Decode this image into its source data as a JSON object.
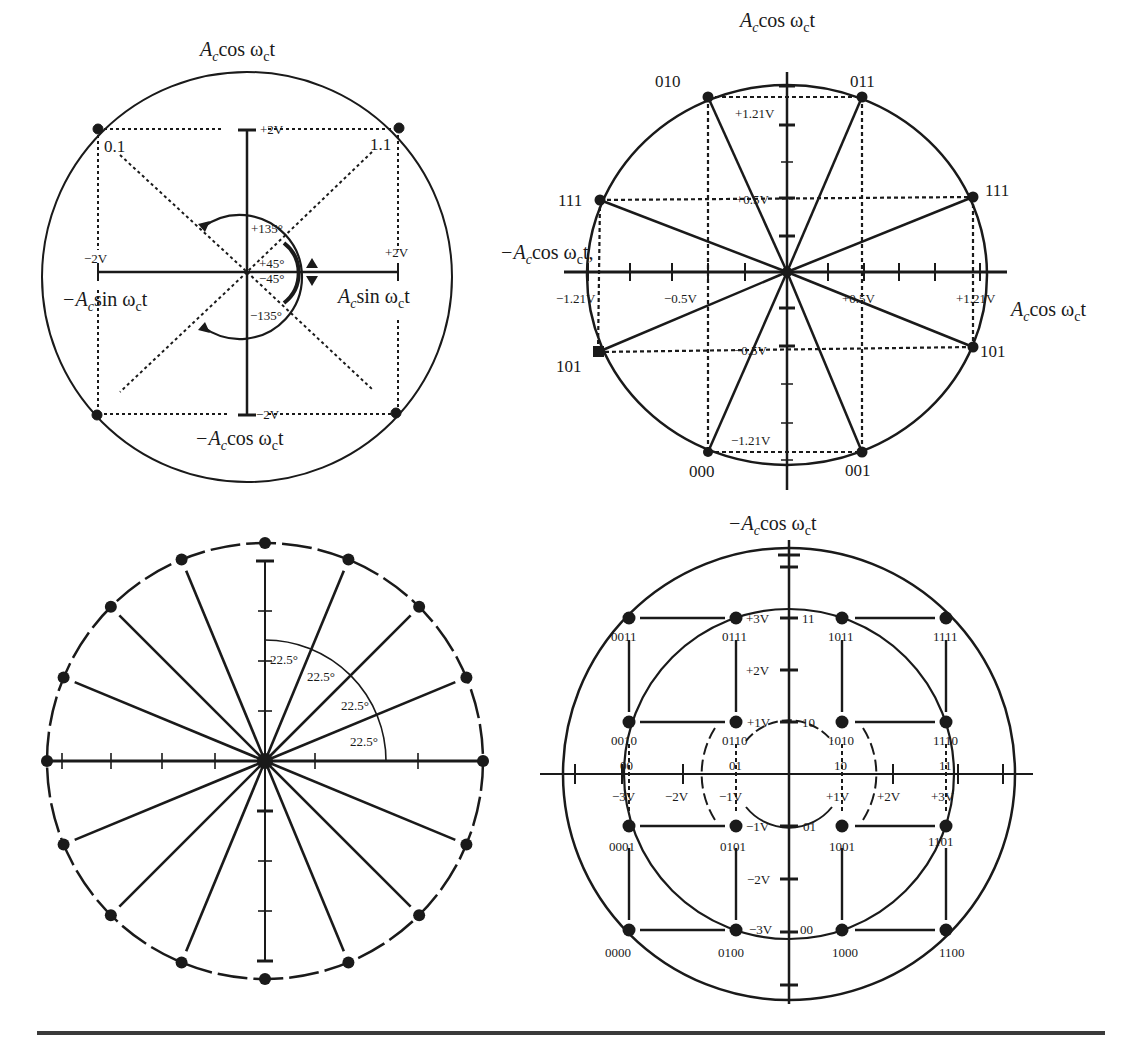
{
  "figure": {
    "rule_color": "#3a3a3a",
    "ink_color": "#1a1a1a"
  },
  "chart_data": [
    {
      "id": "qpsk",
      "type": "scatter",
      "title": "QPSK phasor / constellation",
      "center": [
        247,
        277
      ],
      "outer_radius": 205,
      "axis_labels": {
        "top": "A_c cos ω_c t",
        "bottom": "−A_c cos ω_c t",
        "left": "−A_c sin ω_c t",
        "right": "A_c sin ω_c t"
      },
      "tick_labels": {
        "top": "+2V",
        "bottom": "−2V",
        "left": "−2V",
        "right": "+2V"
      },
      "points": [
        {
          "label": "0.1",
          "x": -2,
          "y": 2
        },
        {
          "label": "1.1",
          "x": 2,
          "y": 2
        },
        {
          "label": "",
          "x": -2,
          "y": -2
        },
        {
          "label": "",
          "x": 2,
          "y": -2
        }
      ],
      "angle_labels": [
        "+135°",
        "+45°",
        "−45°",
        "−135°"
      ]
    },
    {
      "id": "8psk",
      "type": "scatter",
      "title": "8-PSK constellation",
      "center": [
        787,
        272
      ],
      "outer_radius": 198,
      "axis_labels": {
        "top": "A_c cos ω_c t",
        "left": "−A_c cos ω_c t",
        "right": "A_c cos ω_c t"
      },
      "tick_labels": {
        "x": [
          "−1.21V",
          "−0.5V",
          "+0.5V",
          "+1.21V"
        ],
        "y": [
          "+1.21V",
          "+0.5V",
          "−0.5V",
          "−1.21V"
        ]
      },
      "points": [
        {
          "label": "010",
          "x": -0.5,
          "y": 1.21
        },
        {
          "label": "011",
          "x": 0.5,
          "y": 1.21
        },
        {
          "label": "111",
          "x": -1.21,
          "y": 0.5
        },
        {
          "label": "111",
          "x": 1.21,
          "y": 0.5
        },
        {
          "label": "101",
          "x": -1.21,
          "y": -0.5
        },
        {
          "label": "101",
          "x": 1.21,
          "y": -0.5
        },
        {
          "label": "000",
          "x": -0.5,
          "y": -1.21
        },
        {
          "label": "001",
          "x": 0.5,
          "y": -1.21
        }
      ]
    },
    {
      "id": "16psk",
      "type": "scatter",
      "title": "16-PSK constellation",
      "center": [
        265,
        761
      ],
      "outer_radius": 218,
      "point_count": 16,
      "angle_step_deg": 22.5,
      "angle_labels": [
        "22.5°",
        "22.5°",
        "22.5°",
        "22.5°"
      ]
    },
    {
      "id": "16qam",
      "type": "scatter",
      "title": "16-QAM constellation",
      "center": [
        789,
        774
      ],
      "outer_radius": 226,
      "axis_labels": {
        "top": "−A_c cos ω_c t"
      },
      "tick_labels": {
        "x": [
          "−3V",
          "−2V",
          "−1V",
          "+1V",
          "+2V",
          "+3V"
        ],
        "y": [
          "+3V",
          "+2V",
          "+1V",
          "−1V",
          "−2V",
          "−3V"
        ],
        "x_codes": [
          "00",
          "01",
          "10",
          "11"
        ],
        "y_codes": [
          "11",
          "10",
          "01",
          "00"
        ]
      },
      "points": [
        {
          "label": "0011",
          "x": -3,
          "y": 3
        },
        {
          "label": "0111",
          "x": -1,
          "y": 3
        },
        {
          "label": "1011",
          "x": 1,
          "y": 3
        },
        {
          "label": "1111",
          "x": 3,
          "y": 3
        },
        {
          "label": "0010",
          "x": -3,
          "y": 1
        },
        {
          "label": "0110",
          "x": -1,
          "y": 1
        },
        {
          "label": "1010",
          "x": 1,
          "y": 1
        },
        {
          "label": "1110",
          "x": 3,
          "y": 1
        },
        {
          "label": "0001",
          "x": -3,
          "y": -1
        },
        {
          "label": "0101",
          "x": -1,
          "y": -1
        },
        {
          "label": "1001",
          "x": 1,
          "y": -1
        },
        {
          "label": "1101",
          "x": 3,
          "y": -1
        },
        {
          "label": "0000",
          "x": -3,
          "y": -3
        },
        {
          "label": "0100",
          "x": -1,
          "y": -3
        },
        {
          "label": "1000",
          "x": 1,
          "y": -3
        },
        {
          "label": "1100",
          "x": 3,
          "y": -3
        }
      ]
    }
  ],
  "labels": {
    "qpsk": {
      "top_prefix": "A",
      "top_sub": "c",
      "top_mid": "cos ω",
      "top_sub2": "c",
      "top_end": "t",
      "bottom_prefix": "−A",
      "bottom_sub": "c",
      "bottom_mid": "cos ω",
      "bottom_sub2": "c",
      "bottom_end": "t",
      "left_prefix": "−A",
      "left_sub": "c",
      "left_mid": "sin ω",
      "left_sub2": "c",
      "left_end": "t",
      "right_prefix": "A",
      "right_sub": "c",
      "right_mid": "sin ω",
      "right_sub2": "c",
      "right_end": "t",
      "tick_top": "+2V",
      "tick_bottom": "−2V",
      "tick_left": "−2V",
      "tick_right": "+2V",
      "pt_01": "0.1",
      "pt_11": "1.1",
      "ang_p135": "+135°",
      "ang_p45": "+45°",
      "ang_m45": "−45°",
      "ang_m135": "−135°"
    },
    "psk8": {
      "top_prefix": "A",
      "top_sub": "c",
      "top_mid": "cos ω",
      "top_sub2": "c",
      "top_end": "t",
      "left_prefix": "−A",
      "left_sub": "c",
      "left_mid": "cos ω",
      "left_sub2": "c",
      "left_end": "t,",
      "right_prefix": "A",
      "right_sub": "c",
      "right_mid": "cos ω",
      "right_sub2": "c",
      "right_end": "t",
      "x_m121": "−1.21V",
      "x_m05": "−0.5V",
      "x_p05": "+0.5V",
      "x_p121": "+1.21V",
      "y_p121": "+1.21V",
      "y_p05": "+0.5V",
      "y_m05": "−0.5V",
      "y_m121": "−1.21V",
      "p010": "010",
      "p011": "011",
      "p111l": "111",
      "p111r": "111",
      "p101l": "101",
      "p101r": "101",
      "p000": "000",
      "p001": "001"
    },
    "psk16": {
      "a1": "22.5°",
      "a2": "22.5°",
      "a3": "22.5°",
      "a4": "22.5°"
    },
    "qam16": {
      "top_prefix": "−A",
      "top_sub": "c",
      "top_mid": "cos ω",
      "top_sub2": "c",
      "top_end": "t",
      "x_m3": "−3V",
      "x_m2": "−2V",
      "x_m1": "−1V",
      "x_p1": "+1V",
      "x_p2": "+2V",
      "x_p3": "+3V",
      "y_p3": "+3V",
      "y_p2": "+2V",
      "y_p1": "+1V",
      "y_m1": "−1V",
      "y_m2": "−2V",
      "y_m3": "−3V",
      "xc_00": "00",
      "xc_01": "01",
      "xc_10": "10",
      "xc_11": "11",
      "yc_11": "11",
      "yc_10": "10",
      "yc_01": "01",
      "yc_00": "00",
      "p0011": "0011",
      "p0111": "0111",
      "p1011": "1011",
      "p1111": "1111",
      "p0010": "0010",
      "p0110": "0110",
      "p1010": "1010",
      "p1110": "1110",
      "p0001": "0001",
      "p0101": "0101",
      "p1001": "1001",
      "p1101": "1101",
      "p0000": "0000",
      "p0100": "0100",
      "p1000": "1000",
      "p1100": "1100"
    }
  }
}
